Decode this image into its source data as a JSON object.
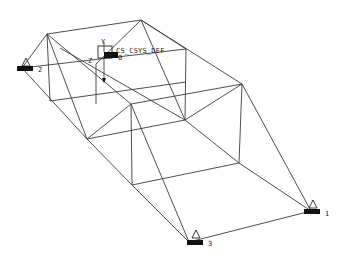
{
  "viewport": {
    "background": "#ffffff",
    "line_color": "#3a3a3a"
  },
  "csys": {
    "label": "CS_CSYS_DEF",
    "axis_y": "Y",
    "axis_z": "Z",
    "axis_x": "X",
    "marker": "0"
  },
  "supports": [
    {
      "id": "pnt2",
      "label": "APNT2",
      "suffix": "2"
    },
    {
      "id": "pnt1",
      "label": "APNT1",
      "suffix": "1"
    },
    {
      "id": "pnt3",
      "label": "APNT3",
      "suffix": "3"
    }
  ],
  "nodes": {
    "A": [
      47,
      34
    ],
    "B": [
      141,
      20
    ],
    "D": [
      186,
      49
    ],
    "E": [
      242,
      84
    ],
    "K": [
      50,
      101
    ],
    "J": [
      131,
      104
    ],
    "H": [
      87,
      139
    ],
    "F": [
      185,
      120
    ],
    "I": [
      132,
      185
    ],
    "G": [
      239,
      163
    ],
    "PNT2": [
      22,
      68
    ],
    "PNT1": [
      311,
      211
    ],
    "PNT3": [
      189,
      242
    ]
  }
}
